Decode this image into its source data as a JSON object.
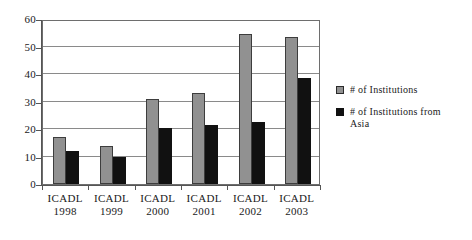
{
  "chart_data": {
    "type": "bar",
    "title": "",
    "subtitle": "",
    "xlabel": "",
    "ylabel": "",
    "ylim": [
      0,
      60
    ],
    "yticks": [
      0,
      10,
      20,
      30,
      40,
      50,
      60
    ],
    "grid": true,
    "legend_position": "right",
    "categories": [
      "ICADL 1998",
      "ICADL 1999",
      "ICADL 2000",
      "ICADL 2001",
      "ICADL 2002",
      "ICADL 2003"
    ],
    "category_lines": [
      {
        "name": "ICADL",
        "year": "1998"
      },
      {
        "name": "ICADL",
        "year": "1999"
      },
      {
        "name": "ICADL",
        "year": "2000"
      },
      {
        "name": "ICADL",
        "year": "2001"
      },
      {
        "name": "ICADL",
        "year": "2002"
      },
      {
        "name": "ICADL",
        "year": "2003"
      }
    ],
    "series": [
      {
        "name": "# of Institutions",
        "color": "#919191",
        "values": [
          17,
          14,
          31,
          33,
          54.5,
          53.5
        ]
      },
      {
        "name": "# of Institutions from Asia",
        "color": "#111111",
        "values": [
          12,
          10,
          20.5,
          21.5,
          22.5,
          38.5
        ]
      }
    ]
  },
  "legend": {
    "entries": [
      {
        "label": "# of Institutions",
        "label_line2": ""
      },
      {
        "label": "# of Institutions from",
        "label_line2": "Asia"
      }
    ]
  },
  "axis": {
    "y_tick_labels": [
      "0",
      "10",
      "20",
      "30",
      "40",
      "50",
      "60"
    ]
  }
}
